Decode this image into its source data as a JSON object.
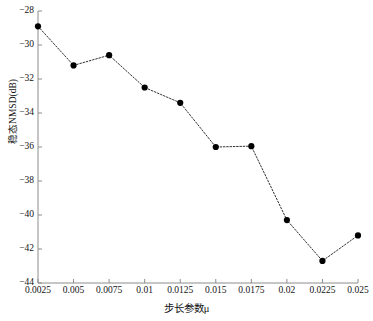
{
  "chart_data": {
    "type": "line",
    "title": "",
    "xlabel": "步长参数μ",
    "ylabel": "稳态NMSD(dB)",
    "x": [
      0.0025,
      0.005,
      0.0075,
      0.01,
      0.0125,
      0.015,
      0.0175,
      0.02,
      0.0225,
      0.025
    ],
    "values": [
      -28.9,
      -31.2,
      -30.6,
      -32.5,
      -33.4,
      -36.0,
      -35.95,
      -40.3,
      -42.7,
      -41.2
    ],
    "series": [
      {
        "name": "稳态NMSD",
        "values": [
          -28.9,
          -31.2,
          -30.6,
          -32.5,
          -33.4,
          -36.0,
          -35.95,
          -40.3,
          -42.7,
          -41.2
        ]
      }
    ],
    "xtick_labels": [
      "0.0025",
      "0.005",
      "0.0075",
      "0.01",
      "0.0125",
      "0.015",
      "0.0175",
      "0.02",
      "0.0225",
      "0.025"
    ],
    "ytick_labels": [
      "−28",
      "−30",
      "−32",
      "−34",
      "−36",
      "−38",
      "−40",
      "−42",
      "−44"
    ],
    "ytick_values": [
      -28,
      -30,
      -32,
      -34,
      -36,
      -38,
      -40,
      -42,
      -44
    ],
    "xlim": [
      0.0025,
      0.025
    ],
    "ylim": [
      -44,
      -28
    ],
    "grid": false,
    "legend": "none",
    "line_style": "dotted",
    "marker": "filled-circle",
    "line_color": "#1a1a1a",
    "marker_color": "#000000"
  }
}
